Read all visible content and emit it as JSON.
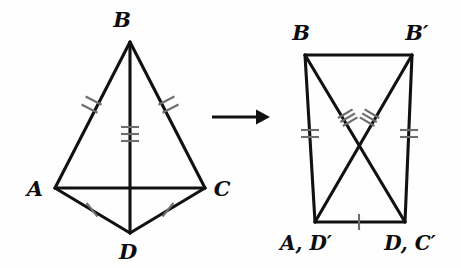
{
  "figure": {
    "background_color": "#fefefe",
    "line_color": "#111111",
    "tick_color": "#6e6e6e"
  },
  "left_figure": {
    "name": "kite-ABCD",
    "labels": {
      "b": "B",
      "a": "A",
      "c": "C",
      "d": "D"
    },
    "vertices": {
      "B": [
        130,
        42
      ],
      "A": [
        55,
        188
      ],
      "C": [
        205,
        188
      ],
      "D": [
        130,
        233
      ]
    },
    "edges": [
      {
        "name": "segment-BA",
        "from": "B",
        "to": "A",
        "ticks": 2
      },
      {
        "name": "segment-BC",
        "from": "B",
        "to": "C",
        "ticks": 2
      },
      {
        "name": "segment-BD",
        "from": "B",
        "to": "D",
        "ticks": 3
      },
      {
        "name": "segment-AC",
        "from": "A",
        "to": "C",
        "ticks": 0
      },
      {
        "name": "segment-AD",
        "from": "A",
        "to": "D",
        "ticks": 1
      },
      {
        "name": "segment-DC",
        "from": "D",
        "to": "C",
        "ticks": 1
      }
    ]
  },
  "arrow": {
    "name": "transformation-arrow",
    "from_x": 212,
    "to_x": 268,
    "y": 117
  },
  "right_figure": {
    "name": "trapezoid-BBprime",
    "labels": {
      "b": "B",
      "b_prime": "B′",
      "a_dprime": "A, D′",
      "d_cprime": "D, C′"
    },
    "vertices": {
      "B": [
        305,
        55
      ],
      "Bprime": [
        412,
        55
      ],
      "ADprime": [
        315,
        222
      ],
      "DCprime": [
        405,
        222
      ]
    },
    "edges": [
      {
        "name": "segment-top-BBprime",
        "from": "B",
        "to": "Bprime",
        "ticks": 0
      },
      {
        "name": "segment-left-B-ADprime",
        "from": "B",
        "to": "ADprime",
        "ticks": 2
      },
      {
        "name": "segment-right-Bprime-DCprime",
        "from": "Bprime",
        "to": "DCprime",
        "ticks": 2
      },
      {
        "name": "segment-bottom-ADprime-DCprime",
        "from": "ADprime",
        "to": "DCprime",
        "ticks": 1
      },
      {
        "name": "diagonal-B-DCprime",
        "from": "B",
        "to": "DCprime",
        "ticks": 3
      },
      {
        "name": "diagonal-Bprime-ADprime",
        "from": "Bprime",
        "to": "ADprime",
        "ticks": 3
      }
    ]
  }
}
